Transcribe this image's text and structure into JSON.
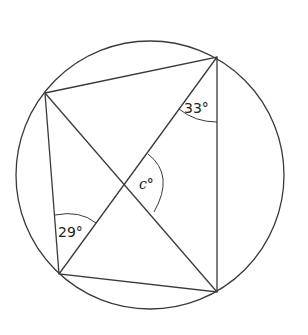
{
  "diagram": {
    "type": "cyclic-quadrilateral",
    "circle": {
      "cx": 150,
      "cy": 175,
      "r": 134
    },
    "vertices": {
      "A": [
        45,
        93
      ],
      "B": [
        217,
        57
      ],
      "C": [
        217,
        292
      ],
      "D": [
        59,
        274
      ]
    },
    "labels": {
      "angle_top": "33°",
      "angle_left": "29°",
      "angle_center": "c°"
    },
    "colors": {
      "stroke": "#3a3a3a",
      "text": "#222222"
    }
  }
}
